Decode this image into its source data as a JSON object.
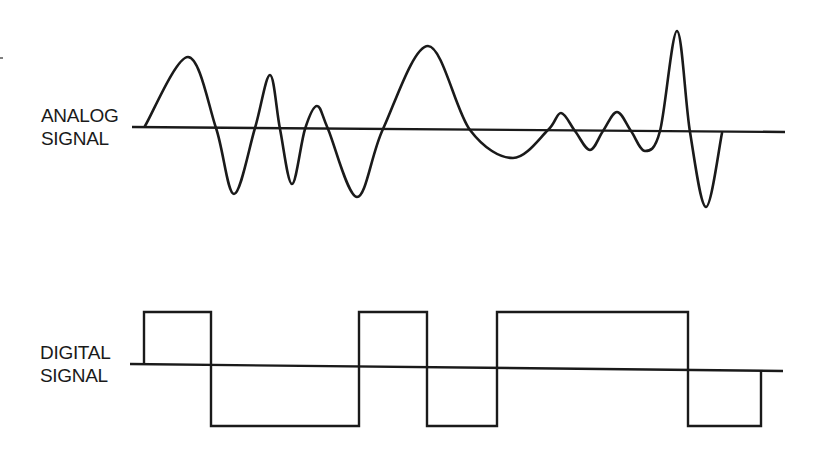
{
  "diagram": {
    "type": "signal-comparison",
    "colors": {
      "background": "#ffffff",
      "ink": "#1a1a1a"
    },
    "analog": {
      "label_line1": "ANALOG",
      "label_line2": "SIGNAL",
      "axis": {
        "x1": 132,
        "y1": 127,
        "x2": 785,
        "y2": 132
      },
      "waveform_points": [
        [
          145,
          126
        ],
        [
          188,
          57
        ],
        [
          216,
          128
        ],
        [
          234,
          194
        ],
        [
          255,
          128
        ],
        [
          270,
          75
        ],
        [
          280,
          129
        ],
        [
          292,
          184
        ],
        [
          305,
          129
        ],
        [
          317,
          106
        ],
        [
          328,
          129
        ],
        [
          357,
          197
        ],
        [
          383,
          129
        ],
        [
          428,
          46
        ],
        [
          470,
          130
        ],
        [
          513,
          158
        ],
        [
          548,
          130
        ],
        [
          561,
          113
        ],
        [
          575,
          131
        ],
        [
          590,
          150
        ],
        [
          603,
          131
        ],
        [
          617,
          112
        ],
        [
          631,
          131
        ],
        [
          645,
          151
        ],
        [
          660,
          131
        ],
        [
          677,
          31
        ],
        [
          690,
          132
        ],
        [
          706,
          207
        ],
        [
          722,
          133
        ]
      ]
    },
    "digital": {
      "label_line1": "DIGITAL",
      "label_line2": "SIGNAL",
      "axis": {
        "x1": 130,
        "y1": 364,
        "x2": 783,
        "y2": 371
      },
      "high_level_y": 312,
      "low_level_y": 426,
      "bits": [
        {
          "from_x": 144,
          "to_x": 211,
          "level": "high"
        },
        {
          "from_x": 211,
          "to_x": 359,
          "level": "low"
        },
        {
          "from_x": 359,
          "to_x": 427,
          "level": "high"
        },
        {
          "from_x": 427,
          "to_x": 497,
          "level": "low"
        },
        {
          "from_x": 497,
          "to_x": 688,
          "level": "high"
        },
        {
          "from_x": 688,
          "to_x": 761,
          "level": "low"
        }
      ]
    }
  }
}
